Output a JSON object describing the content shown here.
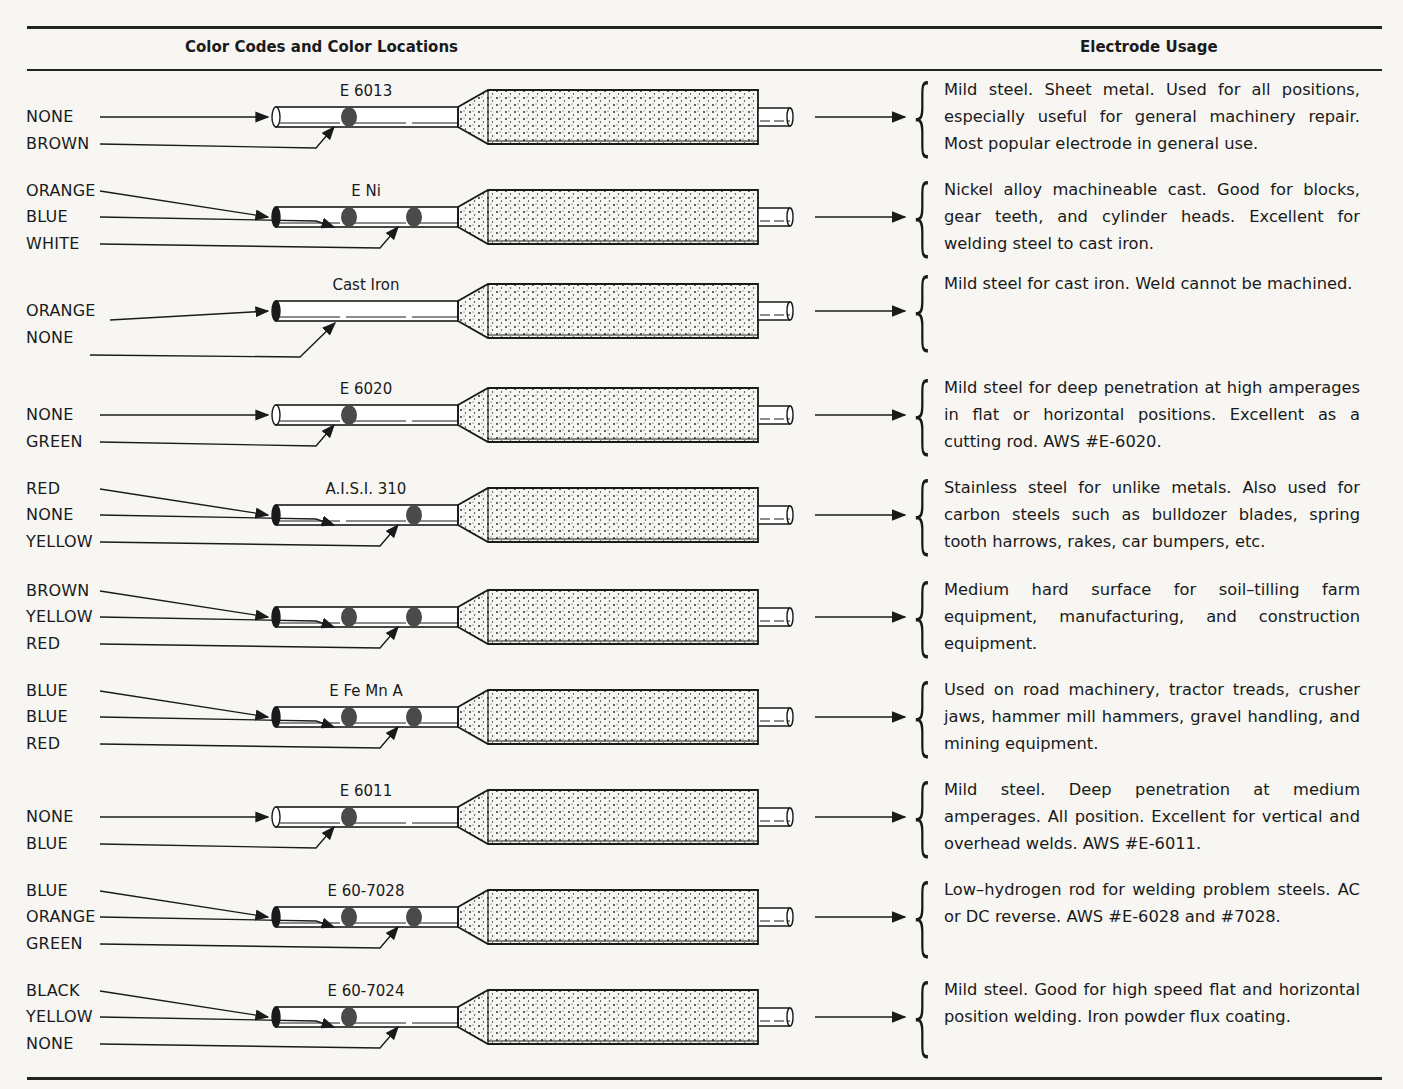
{
  "header": {
    "left": "Color Codes and Color Locations",
    "right": "Electrode Usage"
  },
  "rows": [
    {
      "name": "E 6013",
      "labels": [
        "NONE",
        "BROWN"
      ],
      "dots": [
        1,
        0
      ],
      "end": false,
      "usage": "Mild steel. Sheet metal. Used for all positions, especially useful for general machinery repair. Most popular electrode in general use."
    },
    {
      "name": "E Ni",
      "labels": [
        "ORANGE",
        "BLUE",
        "WHITE"
      ],
      "dots": [
        1,
        1
      ],
      "end": true,
      "usage": "Nickel alloy machineable cast. Good for blocks, gear teeth, and cylinder heads. Excellent for welding steel to cast iron."
    },
    {
      "name": "Cast Iron",
      "labels": [
        "ORANGE",
        "NONE"
      ],
      "dots": [
        0,
        0
      ],
      "end": true,
      "usage": "Mild steel for cast iron. Weld cannot be machined."
    },
    {
      "name": "E 6020",
      "labels": [
        "NONE",
        "GREEN"
      ],
      "dots": [
        1,
        0
      ],
      "end": false,
      "usage": "Mild steel for deep penetration at high amperages in flat or horizontal positions. Excellent as a cutting rod. AWS #E-6020."
    },
    {
      "name": "A.I.S.I. 310",
      "labels": [
        "RED",
        "NONE",
        "YELLOW"
      ],
      "dots": [
        0,
        1
      ],
      "end": true,
      "usage": "Stainless steel for unlike metals. Also used for carbon steels such as bulldozer blades, spring tooth harrows, rakes, car bumpers, etc."
    },
    {
      "name": "",
      "labels": [
        "BROWN",
        "YELLOW",
        "RED"
      ],
      "dots": [
        1,
        1
      ],
      "end": true,
      "usage": "Medium hard surface for soil–tilling farm equipment, manufacturing, and construction equipment."
    },
    {
      "name": "E Fe Mn A",
      "labels": [
        "BLUE",
        "BLUE",
        "RED"
      ],
      "dots": [
        1,
        1
      ],
      "end": true,
      "usage": "Used on road machinery, tractor treads, crusher jaws, hammer mill hammers, gravel handling, and mining equipment."
    },
    {
      "name": "E 6011",
      "labels": [
        "NONE",
        "BLUE"
      ],
      "dots": [
        1,
        0
      ],
      "end": false,
      "usage": "Mild steel. Deep penetration at medium amperages. All position. Excellent for vertical and overhead welds. AWS #E-6011."
    },
    {
      "name": "E 60-7028",
      "labels": [
        "BLUE",
        "ORANGE",
        "GREEN"
      ],
      "dots": [
        1,
        1
      ],
      "end": true,
      "usage": "Low–hydrogen rod for welding problem steels. AC or DC reverse. AWS #E-6028 and #7028."
    },
    {
      "name": "E 60-7024",
      "labels": [
        "BLACK",
        "YELLOW",
        "NONE"
      ],
      "dots": [
        1,
        0
      ],
      "end": true,
      "usage": "Mild steel. Good for high speed flat and horizontal position welding. Iron powder flux coating."
    }
  ],
  "colors": {
    "ink": "#1a1a1a",
    "dot": "#4a4a4a",
    "paper": "#f7f6f3"
  }
}
